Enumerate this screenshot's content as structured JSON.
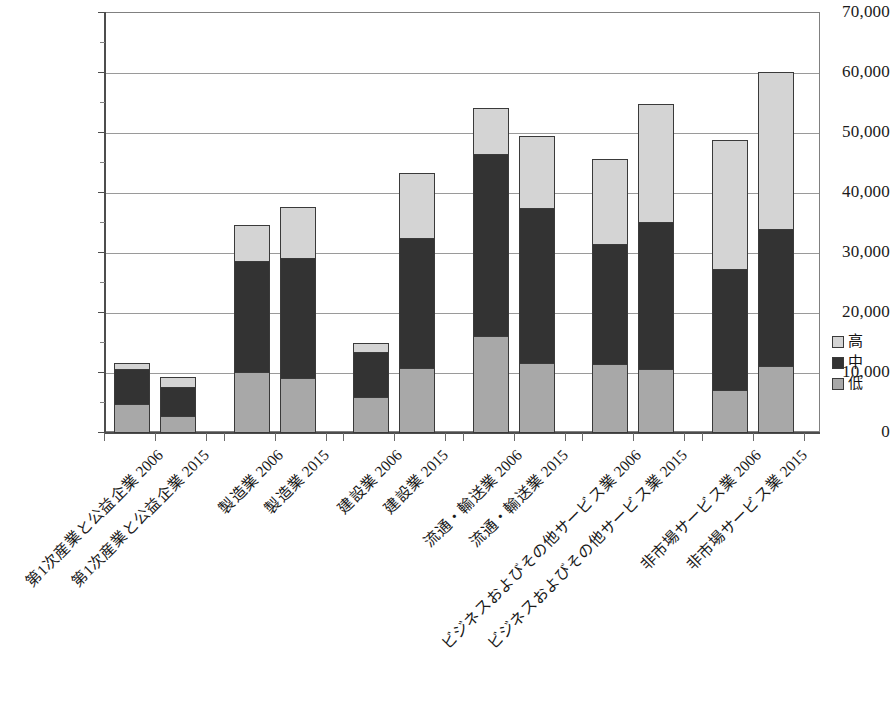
{
  "chart_data": {
    "type": "bar",
    "stacked": true,
    "title": "",
    "subtitle": "",
    "xlabel": "",
    "ylabel": "",
    "ylim": [
      0,
      70000
    ],
    "ytick_step": 10000,
    "yminor_step": 5000,
    "grid": true,
    "legend_position": "right",
    "ytick_labels": [
      "70,000",
      "60,000",
      "50,000",
      "40,000",
      "30,000",
      "20,000",
      "10,000",
      "0"
    ],
    "ytick_values": [
      70000,
      60000,
      50000,
      40000,
      30000,
      20000,
      10000,
      0
    ],
    "categories": [
      "第1次産業と公益企業 2006",
      "第1次産業と公益企業 2015",
      "製造業 2006",
      "製造業 2015",
      "建設業 2006",
      "建設業 2015",
      "流通・輸送業 2006",
      "流通・輸送業 2015",
      "ビジネスおよびその他サービス業 2006",
      "ビジネスおよびその他サービス業 2015",
      "非市場サービス業 2006",
      "非市場サービス業 2015"
    ],
    "series": [
      {
        "name": "低",
        "color": "#a8a8a8",
        "values": [
          4800,
          2900,
          10200,
          9200,
          6000,
          10900,
          16200,
          11700,
          11500,
          10700,
          7200,
          11200
        ]
      },
      {
        "name": "中",
        "color": "#333333",
        "values": [
          6000,
          5000,
          18700,
          20100,
          7700,
          21800,
          30500,
          25900,
          20200,
          24600,
          20300,
          23000
        ]
      },
      {
        "name": "高",
        "color": "#d4d4d4",
        "values": [
          1200,
          1700,
          6100,
          8700,
          1700,
          10900,
          7800,
          12200,
          14300,
          19800,
          21700,
          26300
        ]
      }
    ],
    "series_totals": [
      12000,
      9600,
      35000,
      38000,
      15400,
      43600,
      54500,
      49800,
      46000,
      55100,
      49200,
      60500
    ],
    "segment_tops": {
      "低": [
        4800,
        2900,
        10200,
        9200,
        6000,
        10900,
        16200,
        11700,
        11500,
        10700,
        7200,
        11200
      ],
      "中": [
        10800,
        7900,
        28900,
        29300,
        13700,
        32700,
        46700,
        37600,
        31700,
        35300,
        27500,
        34200
      ],
      "高": [
        12000,
        9600,
        35000,
        38000,
        15400,
        43600,
        54500,
        49800,
        46000,
        55100,
        49200,
        60500
      ]
    }
  },
  "legend": {
    "items": [
      {
        "label": "高",
        "swatch": "#d4d4d4"
      },
      {
        "label": "中",
        "swatch": "#333333"
      },
      {
        "label": "低",
        "swatch": "#a8a8a8"
      }
    ]
  }
}
